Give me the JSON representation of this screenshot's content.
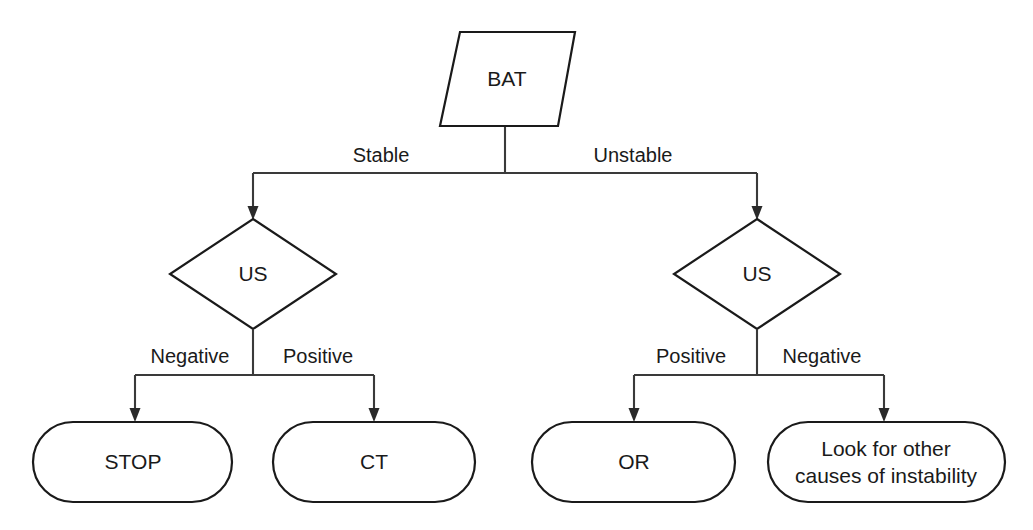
{
  "diagram": {
    "type": "flowchart",
    "background_color": "#ffffff",
    "line_color": "#2a2a2a",
    "text_color": "#1a1a1a",
    "nodes": [
      {
        "id": "bat",
        "label": "BAT",
        "shape": "parallelogram",
        "level": 0
      },
      {
        "id": "us_left",
        "label": "US",
        "shape": "diamond",
        "level": 1
      },
      {
        "id": "us_right",
        "label": "US",
        "shape": "diamond",
        "level": 1
      },
      {
        "id": "stop",
        "label": "STOP",
        "shape": "stadium",
        "level": 2
      },
      {
        "id": "ct",
        "label": "CT",
        "shape": "stadium",
        "level": 2
      },
      {
        "id": "or",
        "label": "OR",
        "shape": "stadium",
        "level": 2
      },
      {
        "id": "other_causes",
        "label": "Look for other causes of instability",
        "label_line1": "Look for other",
        "label_line2": "causes of instability",
        "shape": "stadium",
        "level": 2
      }
    ],
    "edges": [
      {
        "id": "e1",
        "from": "bat",
        "to": "us_left",
        "label": "Stable"
      },
      {
        "id": "e2",
        "from": "bat",
        "to": "us_right",
        "label": "Unstable"
      },
      {
        "id": "e3",
        "from": "us_left",
        "to": "stop",
        "label": "Negative"
      },
      {
        "id": "e4",
        "from": "us_left",
        "to": "ct",
        "label": "Positive"
      },
      {
        "id": "e5",
        "from": "us_right",
        "to": "or",
        "label": "Positive"
      },
      {
        "id": "e6",
        "from": "us_right",
        "to": "other_causes",
        "label": "Negative"
      }
    ]
  }
}
